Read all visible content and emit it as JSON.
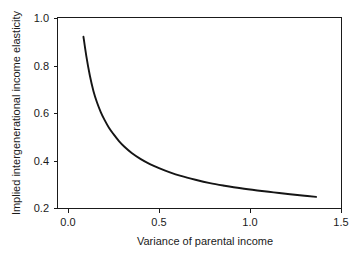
{
  "chart_data": {
    "type": "line",
    "title": "",
    "xlabel": "Variance of parental income",
    "ylabel": "Implied intergenerational income elasticity",
    "xlim": [
      0.0,
      1.5
    ],
    "ylim": [
      0.2,
      1.0
    ],
    "xticks": [
      0.0,
      0.5,
      1.0,
      1.5
    ],
    "xtick_labels": [
      "0.0",
      "0.5",
      "1.0",
      "1.5"
    ],
    "yticks": [
      0.2,
      0.4,
      0.6,
      0.8,
      1.0
    ],
    "ytick_labels": [
      "0.2",
      "0.4",
      "0.6",
      "0.8",
      "1.0"
    ],
    "grid": false,
    "legend": false,
    "series": [
      {
        "name": "Implied elasticity",
        "color": "#151515",
        "x": [
          0.085,
          0.1,
          0.12,
          0.14,
          0.16,
          0.18,
          0.2,
          0.225,
          0.25,
          0.28,
          0.31,
          0.35,
          0.4,
          0.45,
          0.5,
          0.56,
          0.62,
          0.7,
          0.78,
          0.86,
          0.95,
          1.04,
          1.13,
          1.22,
          1.3,
          1.363
        ],
        "y": [
          0.923,
          0.845,
          0.76,
          0.694,
          0.645,
          0.606,
          0.574,
          0.54,
          0.513,
          0.484,
          0.46,
          0.434,
          0.408,
          0.387,
          0.37,
          0.352,
          0.337,
          0.321,
          0.307,
          0.296,
          0.285,
          0.276,
          0.268,
          0.26,
          0.254,
          0.249
        ]
      }
    ]
  },
  "axes": {
    "x_title": "Variance of parental income",
    "y_title": "Implied intergenerational income elasticity",
    "x_tick_0": "0.0",
    "x_tick_1": "0.5",
    "x_tick_2": "1.0",
    "x_tick_3": "1.5",
    "y_tick_0": "0.2",
    "y_tick_1": "0.4",
    "y_tick_2": "0.6",
    "y_tick_3": "0.8",
    "y_tick_4": "1.0"
  },
  "colors": {
    "curve": "#151515",
    "axis": "#1a1a1a",
    "background": "#ffffff"
  }
}
